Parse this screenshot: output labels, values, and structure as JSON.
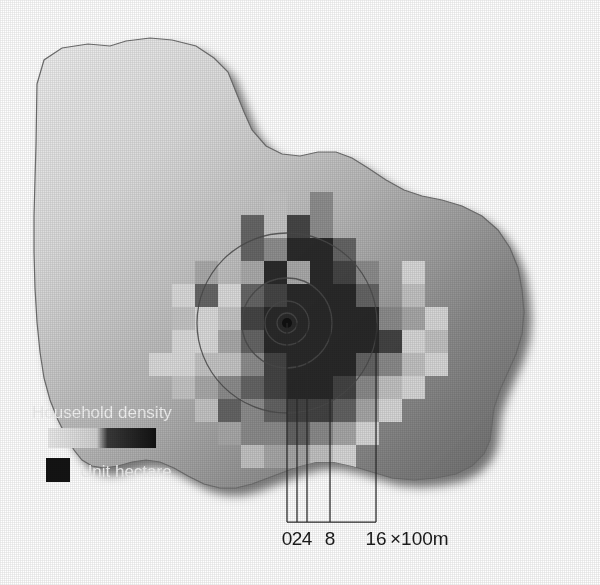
{
  "figure": {
    "type": "choropleth-map"
  },
  "legend": {
    "title": "Household density",
    "unit_label": "Unit hectare",
    "ramp_colors": [
      "#e9e9e9",
      "#d6d6d6",
      "#bdbdbd",
      "#8f8f8f",
      "#3a3a3a",
      "#141414"
    ],
    "unit_swatch_color": "#141414"
  },
  "scale_bar": {
    "ticks": [
      "0",
      "2",
      "4",
      "8",
      "16"
    ],
    "unit_suffix": "×100m",
    "tick_x": [
      287,
      297,
      307,
      330,
      376
    ],
    "axis_y": 522,
    "label_y": 545
  },
  "rings": {
    "center": [
      287,
      323
    ],
    "radii": [
      10,
      22,
      45,
      90
    ],
    "stroke": "#4a4a4a"
  },
  "basemap": {
    "gradient_light": "#ededed",
    "gradient_dark": "#6e6e6e",
    "shadow_color": "#6a6a6a",
    "outline": "#5a5a5a"
  },
  "chart_data": {
    "type": "heatmap",
    "title": "Household density",
    "xlabel": "",
    "ylabel": "",
    "unit": "Unit hectare",
    "cell_size_px": 23,
    "origin_px": [
      149,
      192
    ],
    "value_colors": {
      "0": null,
      "1": "#dcdcdc",
      "2": "#c6c6c6",
      "3": "#a8a8a8",
      "4": "#8a8a8a",
      "5": "#5e5e5e",
      "6": "#3c3c3c",
      "7": "#1e1e1e"
    },
    "grid": [
      [
        0,
        0,
        0,
        0,
        0,
        2,
        0,
        4,
        0,
        0,
        0,
        0,
        0
      ],
      [
        0,
        0,
        0,
        0,
        5,
        2,
        6,
        4,
        0,
        0,
        0,
        0,
        0
      ],
      [
        0,
        0,
        0,
        0,
        5,
        4,
        7,
        7,
        5,
        0,
        0,
        0,
        0
      ],
      [
        0,
        0,
        3,
        0,
        3,
        7,
        3,
        7,
        6,
        4,
        0,
        1,
        0
      ],
      [
        0,
        1,
        5,
        1,
        5,
        6,
        7,
        7,
        7,
        5,
        0,
        2,
        0
      ],
      [
        0,
        2,
        1,
        2,
        6,
        7,
        7,
        7,
        7,
        7,
        4,
        3,
        1
      ],
      [
        0,
        1,
        1,
        3,
        5,
        7,
        7,
        7,
        7,
        7,
        6,
        1,
        2
      ],
      [
        1,
        1,
        2,
        2,
        4,
        6,
        7,
        7,
        7,
        5,
        4,
        2,
        1
      ],
      [
        0,
        2,
        3,
        4,
        5,
        6,
        7,
        7,
        6,
        4,
        2,
        1,
        0
      ],
      [
        0,
        0,
        2,
        5,
        4,
        5,
        6,
        6,
        5,
        3,
        1,
        0,
        0
      ],
      [
        0,
        0,
        0,
        3,
        4,
        4,
        5,
        4,
        3,
        1,
        0,
        0,
        0
      ],
      [
        0,
        0,
        0,
        0,
        2,
        3,
        3,
        2,
        1,
        0,
        0,
        0,
        0
      ]
    ]
  }
}
